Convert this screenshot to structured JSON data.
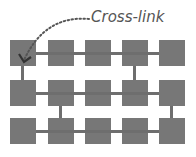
{
  "diagram": {
    "annotation_label": "Cross-link",
    "colors": {
      "node": "#777777",
      "link": "#6e6e6e",
      "annotation": "#555555"
    },
    "grid": {
      "rows": 3,
      "cols": 5
    },
    "vertical_links": [
      {
        "from": [
          0,
          0
        ],
        "to": [
          1,
          0
        ]
      },
      {
        "from": [
          0,
          3
        ],
        "to": [
          1,
          3
        ]
      },
      {
        "from": [
          1,
          1
        ],
        "to": [
          2,
          1
        ]
      },
      {
        "from": [
          1,
          4
        ],
        "to": [
          2,
          4
        ]
      }
    ]
  }
}
